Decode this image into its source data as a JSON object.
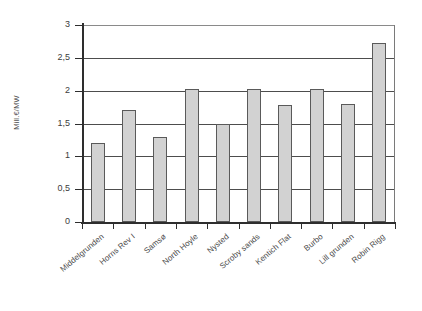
{
  "chart_data": {
    "type": "bar",
    "title": "",
    "xlabel": "",
    "ylabel": "Mill.€/MW",
    "ylim": [
      0,
      3
    ],
    "ytick_labels": [
      "0",
      "0,5",
      "1",
      "1,5",
      "2",
      "2,5",
      "3"
    ],
    "ytick_values": [
      0,
      0.5,
      1,
      1.5,
      2,
      2.5,
      3
    ],
    "grid": true,
    "legend": null,
    "categories": [
      "Middelgrunden",
      "Horns Rev I",
      "Samsø",
      "North Hoyle",
      "Nysted",
      "Scroby sands",
      "Kentich Flat",
      "Burbo",
      "Lill grunden",
      "Robin Rigg"
    ],
    "values": [
      1.2,
      1.7,
      1.3,
      2.03,
      1.5,
      2.03,
      1.78,
      2.03,
      1.8,
      2.73
    ],
    "colors": {
      "bar_fill": "#d2d2d2",
      "bar_stroke": "#5a5a5a",
      "axis": "#2e2e2e",
      "gridline": "#4d4d4d",
      "text": "#4a4a4a",
      "background": "#ffffff"
    }
  }
}
